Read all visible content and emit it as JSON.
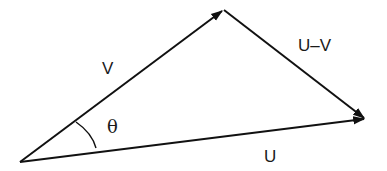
{
  "diagram": {
    "type": "vector-triangle",
    "stroke_color": "#111111",
    "background": "#ffffff",
    "vertices": {
      "origin": [
        20,
        162
      ],
      "top": [
        223,
        10
      ],
      "right": [
        365,
        119
      ]
    },
    "edges": [
      {
        "name": "V",
        "from": "origin",
        "to": "top",
        "arrow": true
      },
      {
        "name": "U",
        "from": "origin",
        "to": "right",
        "arrow": true
      },
      {
        "name": "U-V",
        "from": "top",
        "to": "right",
        "arrow": true
      }
    ],
    "labels": {
      "v": "V",
      "u": "U",
      "u_minus_v": "U–V",
      "theta": "θ"
    }
  }
}
